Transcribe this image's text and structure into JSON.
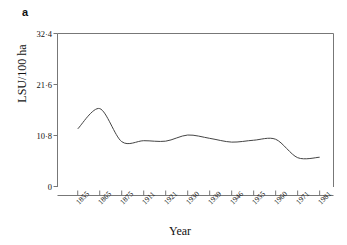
{
  "panel": {
    "label": "a"
  },
  "chart_data": {
    "type": "line",
    "title": "",
    "xlabel": "Year",
    "ylabel": "LSU/100 ha",
    "grid": false,
    "legend": "none",
    "line_color": "#444444",
    "axis_color": "#777777",
    "text_color": "#111111",
    "ylim": [
      0,
      32.4
    ],
    "yticks": [
      0,
      10.8,
      21.6,
      32.4
    ],
    "ytick_labels": [
      "0",
      "10·8",
      "21·6",
      "32·4"
    ],
    "categories": [
      "1855",
      "1865",
      "1875",
      "1911",
      "1921",
      "1930",
      "1939",
      "1946",
      "1955",
      "1960",
      "1971",
      "1981"
    ],
    "values": [
      12.2,
      16.5,
      9.5,
      9.7,
      9.6,
      10.9,
      10.2,
      9.4,
      9.8,
      10.0,
      6.1,
      6.2
    ],
    "series": [
      {
        "name": "Livestock units per 100 ha",
        "values": [
          12.2,
          16.5,
          9.5,
          9.7,
          9.6,
          10.9,
          10.2,
          9.4,
          9.8,
          10.0,
          6.1,
          6.2
        ]
      }
    ]
  }
}
